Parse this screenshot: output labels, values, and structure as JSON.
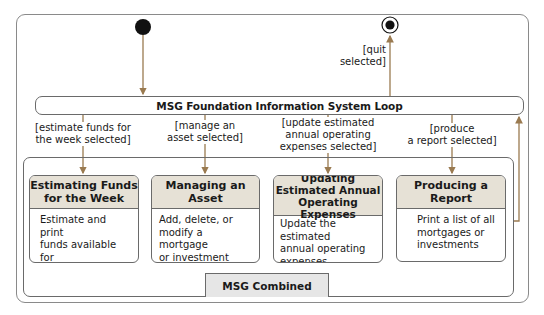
{
  "diagram": {
    "type": "UML state diagram",
    "loop_state": {
      "title": "MSG Foundation Information System Loop"
    },
    "initial_node": {
      "label": "initial-state"
    },
    "final_node": {
      "label": "final-state",
      "guard": [
        "[quit",
        "selected]"
      ]
    },
    "composite": {
      "label": "MSG Combined"
    },
    "guards": [
      {
        "lines": [
          "[estimate funds for",
          "the week selected]"
        ]
      },
      {
        "lines": [
          "[manage an",
          "asset selected]"
        ]
      },
      {
        "lines": [
          "[update estimated",
          "annual operating",
          "expenses selected]"
        ]
      },
      {
        "lines": [
          "[produce",
          "a report selected]"
        ]
      }
    ],
    "states": [
      {
        "title": [
          "Estimating Funds",
          "for the Week"
        ],
        "body": [
          "Estimate and print",
          "funds available for",
          "the current week"
        ]
      },
      {
        "title": [
          "Managing an",
          "Asset"
        ],
        "body": [
          "Add, delete, or",
          "modify a mortgage",
          "or investment"
        ]
      },
      {
        "title": [
          "Updating",
          "Estimated Annual",
          "Operating Expenses"
        ],
        "body": [
          "Update the estimated",
          "annual operating",
          "expenses"
        ]
      },
      {
        "title": [
          "Producing a",
          "Report"
        ],
        "body": [
          "Print a list of all",
          "mortgages or",
          "investments"
        ]
      }
    ],
    "colors": {
      "arrow": "#9a7a50",
      "state_header": "#e6e1d6",
      "tab_fill": "#e6e6e6",
      "border": "#6a6a6a"
    }
  }
}
